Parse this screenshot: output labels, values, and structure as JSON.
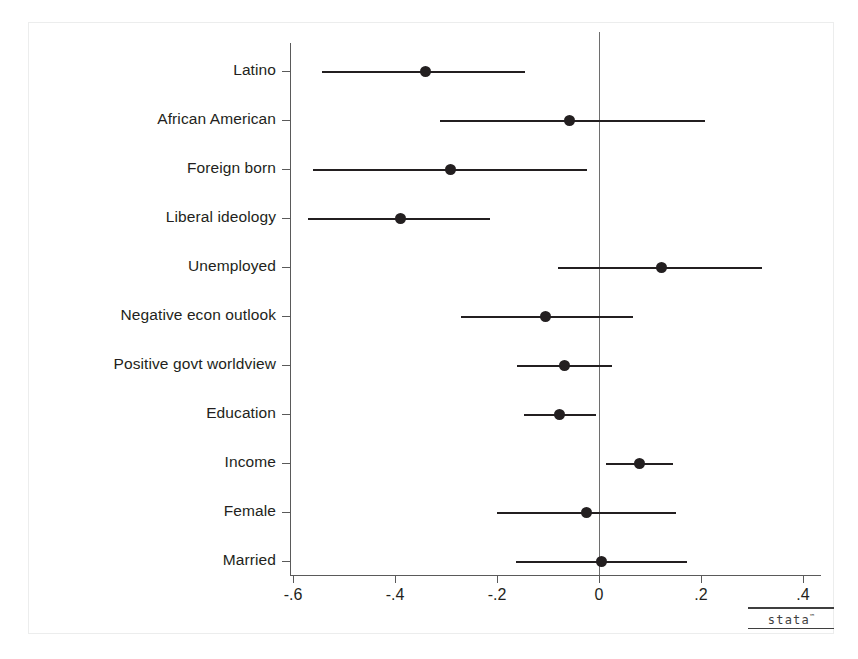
{
  "chart_data": {
    "type": "scatter",
    "title": "",
    "subtitle": "",
    "xlabel": "",
    "ylabel": "",
    "orientation": "horizontal",
    "grid": false,
    "legend": null,
    "zero_reference_line": 0,
    "xlim": [
      -0.66,
      0.46
    ],
    "xticks": [
      -0.6,
      -0.4,
      -0.2,
      0,
      0.2,
      0.4
    ],
    "xticklabels": [
      "-.6",
      "-.4",
      "-.2",
      "0",
      ".2",
      ".4"
    ],
    "categories": [
      "Latino",
      "African American",
      "Foreign born",
      "Liberal ideology",
      "Unemployed",
      "Negative econ outlook",
      "Positive govt worldview",
      "Education",
      "Income",
      "Female",
      "Married"
    ],
    "series": [
      {
        "name": "Coefficient estimate with 95% confidence interval",
        "points": [
          {
            "category": "Latino",
            "estimate": -0.341,
            "ci_low": -0.543,
            "ci_high": -0.145
          },
          {
            "category": "African American",
            "estimate": -0.057,
            "ci_low": -0.312,
            "ci_high": 0.208
          },
          {
            "category": "Foreign born",
            "estimate": -0.292,
            "ci_low": -0.561,
            "ci_high": -0.024
          },
          {
            "category": "Liberal ideology",
            "estimate": -0.39,
            "ci_low": -0.571,
            "ci_high": -0.214
          },
          {
            "category": "Unemployed",
            "estimate": 0.122,
            "ci_low": -0.08,
            "ci_high": 0.32
          },
          {
            "category": "Negative econ outlook",
            "estimate": -0.104,
            "ci_low": -0.271,
            "ci_high": 0.067
          },
          {
            "category": "Positive govt worldview",
            "estimate": -0.067,
            "ci_low": -0.161,
            "ci_high": 0.025
          },
          {
            "category": "Education",
            "estimate": -0.078,
            "ci_low": -0.147,
            "ci_high": -0.006
          },
          {
            "category": "Income",
            "estimate": 0.08,
            "ci_low": 0.014,
            "ci_high": 0.145
          },
          {
            "category": "Female",
            "estimate": -0.025,
            "ci_low": -0.2,
            "ci_high": 0.151
          },
          {
            "category": "Married",
            "estimate": 0.004,
            "ci_low": -0.163,
            "ci_high": 0.173
          }
        ]
      }
    ]
  },
  "branding": {
    "wordmark": "stata",
    "trademark": "™"
  },
  "colors": {
    "marker": "#231f20",
    "axis": "#5a5a5a",
    "zero_line": "#6e6e6e",
    "frame": "#eceded",
    "background": "#ffffff",
    "text": "#231f20"
  }
}
